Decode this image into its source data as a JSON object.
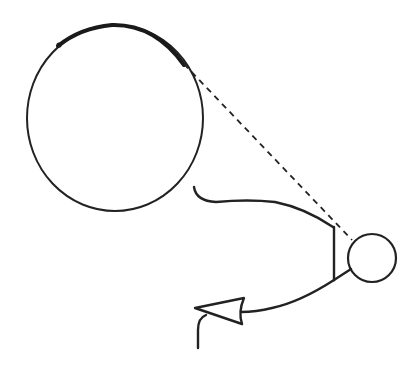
{
  "diagram": {
    "colors": {
      "background": "#ffffff",
      "stroke": "#222222"
    },
    "shapes": {
      "large_circle": {
        "cx": 115,
        "cy": 118,
        "rx": 88,
        "ry": 93
      },
      "thick_arc": {
        "from": [
          58,
          45
        ],
        "to": [
          183,
          65
        ]
      },
      "dashed_line": {
        "from": [
          183,
          64
        ],
        "to": [
          352,
          240
        ]
      },
      "small_circle": {
        "cx": 372,
        "cy": 258,
        "r": 24
      },
      "upper_curve": {
        "from": [
          196,
          188
        ],
        "to": [
          333,
          228
        ]
      },
      "vertical_line": {
        "from": [
          334,
          228
        ],
        "to": [
          334,
          280
        ]
      },
      "lower_arm": {
        "from": [
          334,
          280
        ],
        "to": [
          351,
          270
        ]
      },
      "arrow_shaft": {
        "from": [
          334,
          280
        ],
        "to": [
          241,
          312
        ]
      },
      "arrowhead": {
        "tip": [
          195,
          308
        ],
        "back_top": [
          244,
          298
        ],
        "back_bottom": [
          243,
          325
        ]
      },
      "hook": {
        "from": [
          205,
          314
        ],
        "to": [
          198,
          348
        ]
      }
    }
  }
}
